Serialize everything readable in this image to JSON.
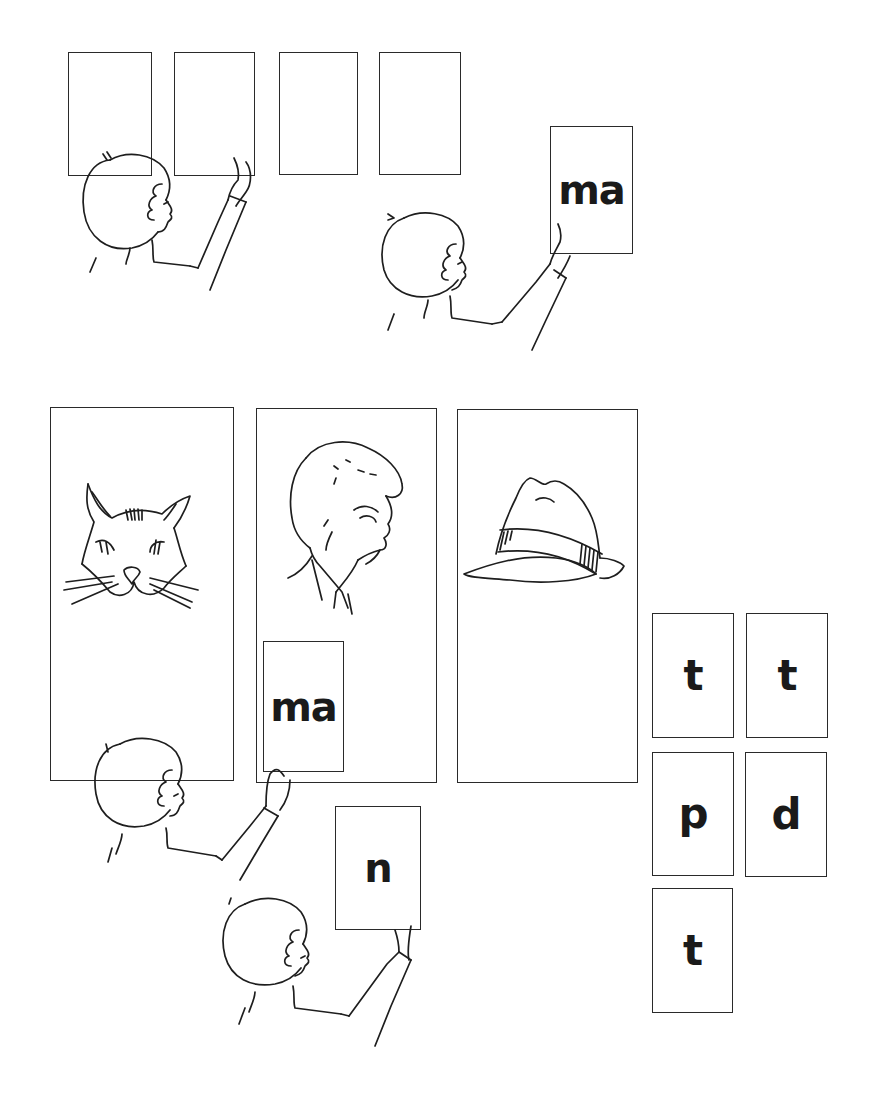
{
  "scene1": {
    "blank_cards": [
      {
        "label": ""
      },
      {
        "label": ""
      },
      {
        "label": ""
      },
      {
        "label": ""
      }
    ],
    "held_card": {
      "label": "ma"
    }
  },
  "scene2": {
    "picture_panels": [
      {
        "picture": "cat",
        "icon": "cat-icon"
      },
      {
        "picture": "man",
        "icon": "man-face-icon"
      },
      {
        "picture": "hat",
        "icon": "hat-icon"
      }
    ],
    "placed_card": {
      "label": "ma"
    },
    "held_card": {
      "label": "n"
    },
    "letter_cards": [
      {
        "label": "t"
      },
      {
        "label": "t"
      },
      {
        "label": "p"
      },
      {
        "label": "d"
      },
      {
        "label": "t"
      }
    ]
  },
  "colors": {
    "ink": "#1e1e1e",
    "paper": "#ffffff"
  }
}
